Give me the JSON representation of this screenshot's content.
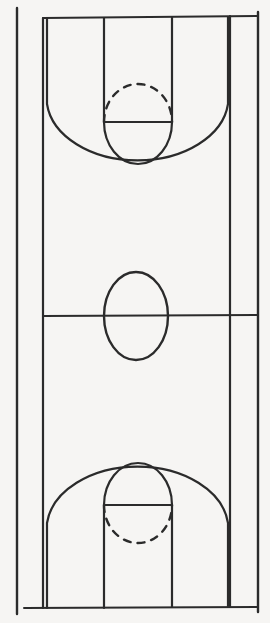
{
  "figure": {
    "name": "basketball-court-diagram",
    "orientation": "vertical",
    "style": "hand-drawn line diagram",
    "background_color": "#f6f5f3",
    "line_color": "#2b2b2b",
    "width_px": 270,
    "height_px": 623
  },
  "geometry": {
    "sideline_left_x": 17,
    "sideline_right_x": 258,
    "boundary_left_x": 43,
    "boundary_right_x": 257,
    "baseline_top_y": 18,
    "baseline_bottom_y": 608,
    "midline_y": 316,
    "lane_left_x": 104,
    "lane_right_x": 172,
    "three_point_left_x": 47,
    "three_point_right_x": 228,
    "center_circle_cx": 136,
    "center_circle_cy": 316,
    "center_circle_rx": 32,
    "center_circle_ry": 44
  },
  "elements": {
    "sideline_left": {
      "label": "Left sideline",
      "path": "M 17 8 L 17 614"
    },
    "sideline_right": {
      "label": "Right sideline",
      "path": "M 258 12 L 258 612"
    },
    "boundary_top": {
      "label": "Top baseline / end line",
      "path": "M 43 18 L 258 16"
    },
    "boundary_bottom": {
      "label": "Bottom baseline / end line",
      "path": "M 24 608 L 257 607"
    },
    "inner_left_line": {
      "label": "Left court boundary line",
      "path": "M 43 18 L 43 608"
    },
    "inner_right_line": {
      "label": "Right court boundary line",
      "path": "M 230 16 L 230 607"
    },
    "midline": {
      "label": "Mid court line / half-court line",
      "path": "M 43 316 L 258 315"
    },
    "center_circle": {
      "label": "Center circle / jump ball circle",
      "cx": 136,
      "cy": 316,
      "rx": 32,
      "ry": 44
    },
    "lane_top_left": {
      "label": "Top key left lane line",
      "path": "M 104 18 L 104 122"
    },
    "lane_top_right": {
      "label": "Top key right lane line",
      "path": "M 172 17 L 172 122"
    },
    "free_throw_line_top": {
      "label": "Top free throw line",
      "path": "M 104 122 L 172 122"
    },
    "free_throw_circle_top_dashed": {
      "label": "Top free throw circle upper dashed arc",
      "path": "M 104 122 A 34 38 0 0 1 172 122",
      "dash": "7 7"
    },
    "free_throw_circle_top_solid": {
      "label": "Top free throw circle lower solid arc",
      "path": "M 104 122 A 34 42 0 0 0 172 122"
    },
    "three_point_arc_top": {
      "label": "Top three point line",
      "path": "M 47 18 L 47 104 A 91 63 0 0 0 228 104 L 228 17",
      "straight_left": "M 47 18 L 47 104",
      "straight_right": "M 228 17 L 228 104"
    },
    "lane_bottom_left": {
      "label": "Bottom key left lane line",
      "path": "M 104 505 L 104 608"
    },
    "lane_bottom_right": {
      "label": "Bottom key right lane line",
      "path": "M 172 505 L 172 607"
    },
    "free_throw_line_bottom": {
      "label": "Bottom free throw line",
      "path": "M 104 505 L 172 505"
    },
    "free_throw_circle_bottom_solid": {
      "label": "Bottom free throw circle upper solid arc",
      "path": "M 104 505 A 34 42 0 0 1 172 505"
    },
    "free_throw_circle_bottom_dashed": {
      "label": "Bottom free throw circle lower dashed arc",
      "path": "M 104 505 A 34 38 0 0 0 172 505",
      "dash": "7 7"
    },
    "three_point_arc_bottom": {
      "label": "Bottom three point line",
      "path": "M 47 608 L 47 523 A 91 63 0 0 1 228 523 L 228 607",
      "straight_left": "M 47 608 L 47 523",
      "straight_right": "M 228 607 L 228 523"
    }
  }
}
